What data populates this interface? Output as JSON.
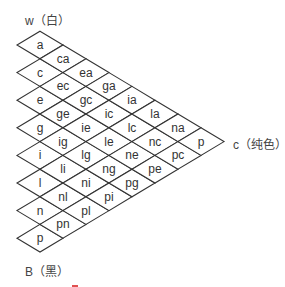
{
  "axis_labels": {
    "top": "w（白）",
    "right": "c（纯色）",
    "bottom": "B（黑）"
  },
  "grid": {
    "description": "Ostwald color solid cross-section: triangular grid of diamond cells",
    "columns": [
      [
        "a",
        "c",
        "e",
        "g",
        "i",
        "l",
        "n",
        "p"
      ],
      [
        "ca",
        "ec",
        "ge",
        "ig",
        "li",
        "nl",
        "pn"
      ],
      [
        "ea",
        "gc",
        "ie",
        "lg",
        "ni",
        "pl"
      ],
      [
        "ga",
        "ic",
        "le",
        "ng",
        "pi"
      ],
      [
        "ia",
        "lc",
        "ne",
        "pg"
      ],
      [
        "la",
        "nc",
        "pe"
      ],
      [
        "na",
        "pc"
      ],
      [
        "p"
      ]
    ]
  },
  "colors": {
    "stroke": "#333333",
    "text": "#333333",
    "background": "#ffffff"
  }
}
